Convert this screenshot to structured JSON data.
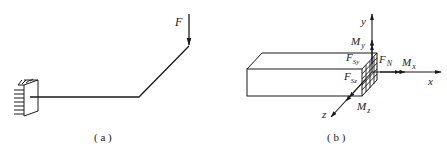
{
  "figure_a": {
    "caption": "( a )",
    "force_label": "F",
    "description": "Cantilever bent beam fixed to wall at left, horizontal segment then inclined segment, vertical downward force F at free end"
  },
  "figure_b": {
    "caption": "( b )",
    "axes": {
      "x": "x",
      "y": "y",
      "z": "z"
    },
    "internal_forces": {
      "axial": {
        "base": "F",
        "sub": "N"
      },
      "shear_y": {
        "base": "F",
        "sub": "Sy"
      },
      "shear_z": {
        "base": "F",
        "sub": "Sz"
      },
      "moment_x": {
        "base": "M",
        "sub": "x"
      },
      "moment_y": {
        "base": "M",
        "sub": "y"
      },
      "moment_z": {
        "base": "M",
        "sub": "z"
      }
    }
  },
  "colors": {
    "line": "#1a1a1a",
    "background": "#ffffff"
  }
}
